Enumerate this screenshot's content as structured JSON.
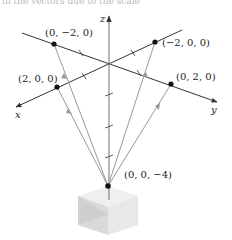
{
  "caption_fragment": "in the vectors due to the scale",
  "axes": {
    "x": {
      "label": "x"
    },
    "y": {
      "label": "y"
    },
    "z": {
      "label": "z"
    }
  },
  "points": [
    {
      "id": "p_y_neg",
      "label": "(0, −2, 0)"
    },
    {
      "id": "p_x_neg",
      "label": "(−2, 0, 0)"
    },
    {
      "id": "p_x_pos",
      "label": "(2, 0, 0)"
    },
    {
      "id": "p_y_pos",
      "label": "(0, 2, 0)"
    },
    {
      "id": "p_apex",
      "label": "(0, 0, −4)"
    }
  ],
  "colors": {
    "axis": "#333333",
    "vector": "#999999",
    "point": "#111111",
    "cube_top": "#eeeeee",
    "cube_left": "#d6d6d6",
    "cube_right": "#e6e6e6"
  }
}
